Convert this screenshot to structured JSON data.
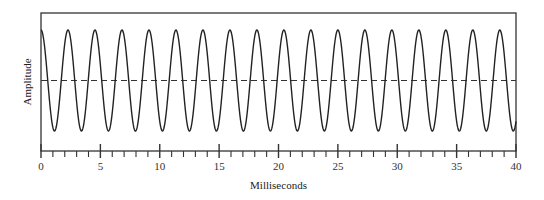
{
  "chart_data": {
    "type": "line",
    "title": "",
    "xlabel": "Milliseconds",
    "ylabel": "Amplitude",
    "xlim": [
      0,
      40
    ],
    "ylim": [
      -1,
      1
    ],
    "x_major_ticks": [
      0,
      5,
      10,
      15,
      20,
      25,
      30,
      35,
      40
    ],
    "x_minor_tick_step": 1,
    "y_ticks": [],
    "grid": false,
    "legend": null,
    "series": [
      {
        "name": "sine wave",
        "function": "cos(2*pi*f*t)",
        "frequency_hz": 440,
        "period_ms": 2.27,
        "amplitude": 1,
        "phase_start": "peak",
        "cycles_shown": 17.6
      }
    ],
    "annotations": [
      {
        "type": "dashed_horizontal_line",
        "y": 0,
        "label": ""
      }
    ]
  }
}
